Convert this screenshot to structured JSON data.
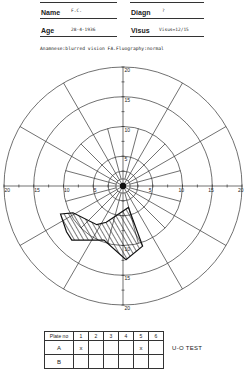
{
  "header": {
    "name_label": "Name",
    "name_value": "F.C.",
    "diagn_label": "Diagn",
    "diagn_value": "?",
    "age_label": "Age",
    "age_value": "28-4-1936",
    "visus_label": "Visus",
    "visus_value": "Visus=12/15"
  },
  "anamnese": "Anamnese:blurred vision FA.Fluography:normal",
  "chart_data": {
    "type": "polar-visual-field",
    "radial_rings": [
      2.5,
      5,
      10,
      15,
      20
    ],
    "radial_unit": "degrees",
    "spokes_every_deg": 30,
    "axis_tick_labels": {
      "up": [
        "5",
        "10",
        "15",
        "20"
      ],
      "down": [
        "10",
        "15",
        "20"
      ],
      "left": [
        "5",
        "10",
        "15",
        "20"
      ],
      "right": [
        "5",
        "10",
        "15",
        "20"
      ]
    },
    "scotoma": {
      "description": "hatched defect in lower-left quadrant",
      "points_xy_deg": [
        [
          -10.5,
          -4.7
        ],
        [
          -8.4,
          -4.5
        ],
        [
          -4.4,
          -6.5
        ],
        [
          -2.8,
          -6.1
        ],
        [
          0.9,
          -3.6
        ],
        [
          3.3,
          -10.1
        ],
        [
          0.5,
          -12.4
        ],
        [
          -3.2,
          -9.1
        ],
        [
          -8.6,
          -9.1
        ],
        [
          -9.5,
          -7.7
        ]
      ]
    }
  },
  "plates_table": {
    "header_label": "Plate no",
    "columns": [
      "1",
      "2",
      "3",
      "4",
      "5",
      "6"
    ],
    "rows": [
      {
        "label": "A",
        "cells": [
          "x",
          "",
          "",
          "",
          "x",
          ""
        ]
      },
      {
        "label": "B",
        "cells": [
          "",
          "",
          "",
          "",
          "",
          ""
        ]
      }
    ],
    "test_label": "U-O  TEST"
  }
}
